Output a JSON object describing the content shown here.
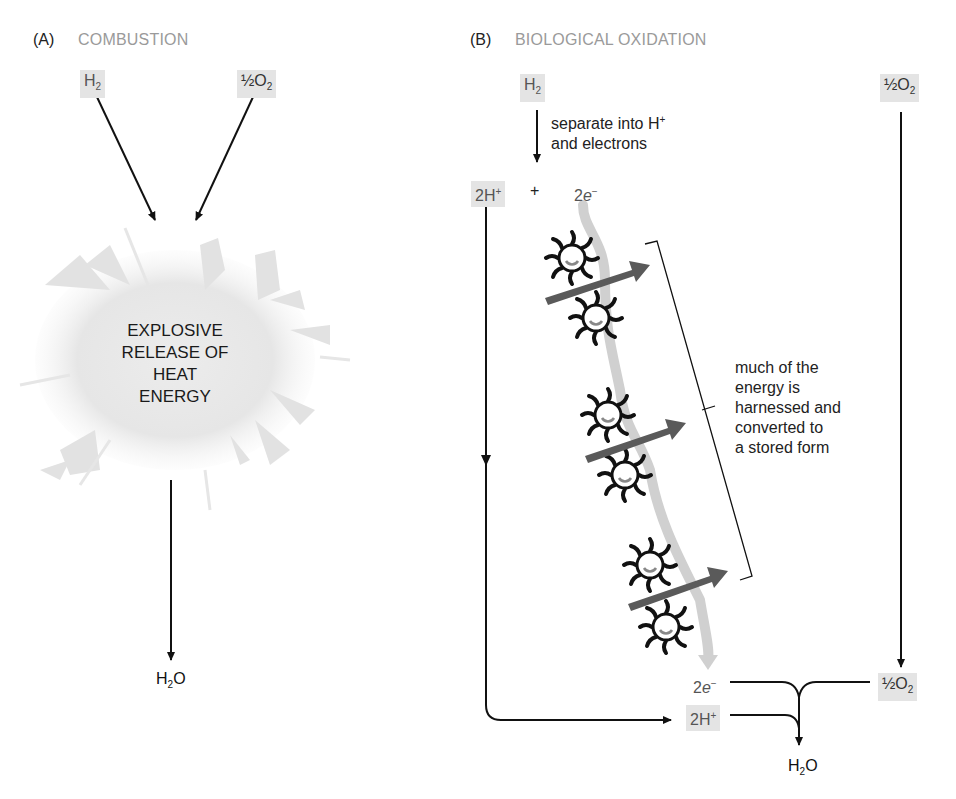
{
  "panel_a": {
    "label": "(A)",
    "title": "COMBUSTION",
    "reactant_1": "H",
    "reactant_1_sub": "2",
    "reactant_2_prefix": "½O",
    "reactant_2_sub": "2",
    "explosion_lines": [
      "EXPLOSIVE",
      "RELEASE OF",
      "HEAT",
      "ENERGY"
    ],
    "product": "H",
    "product_sub": "2",
    "product_suffix": "O"
  },
  "panel_b": {
    "label": "(B)",
    "title": "BIOLOGICAL OXIDATION",
    "h2": "H",
    "h2_sub": "2",
    "o2_top_prefix": "½O",
    "o2_top_sub": "2",
    "separate_line1": "separate into H",
    "separate_line1_sup": "+",
    "separate_line2": "and electrons",
    "protons": "2H",
    "protons_sup": "+",
    "plus": "+",
    "electrons_num": "2",
    "electrons_e": "e",
    "electrons_sup": "−",
    "energy_note": [
      "much of the",
      "energy is",
      "harnessed and",
      "converted to",
      "a stored form"
    ],
    "bottom_electrons_num": "2",
    "bottom_electrons_e": "e",
    "bottom_electrons_sup": "−",
    "bottom_protons": "2H",
    "bottom_protons_sup": "+",
    "o2_bottom_prefix": "½O",
    "o2_bottom_sub": "2",
    "product": "H",
    "product_sub": "2",
    "product_suffix": "O"
  },
  "colors": {
    "chem_box_bg": "#e4e4e4",
    "title_gray": "#9a9a9a",
    "arrow_dark": "#111111",
    "energy_arrow": "#5a5a5a",
    "electron_ribbon": "#cfcfcf",
    "burst_gray": "#e2e2e2"
  }
}
